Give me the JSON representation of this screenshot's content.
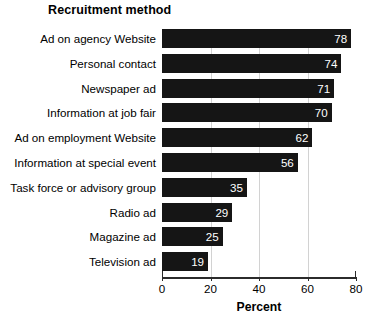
{
  "chart_data": {
    "type": "bar",
    "orientation": "horizontal",
    "title": "Recruitment method",
    "xlabel": "Percent",
    "ylabel": "",
    "xlim": [
      0,
      80
    ],
    "xticks": [
      0,
      20,
      40,
      60,
      80
    ],
    "xtick_labels": [
      "0",
      "20",
      "40",
      "60",
      "80"
    ],
    "grid": "vertical",
    "legend": "none",
    "bar_color": "#151515",
    "value_label_color": "#ffffff",
    "categories": [
      "Ad on agency Website",
      "Personal contact",
      "Newspaper ad",
      "Information at job fair",
      "Ad on employment Website",
      "Information at special event",
      "Task force or advisory group",
      "Radio ad",
      "Magazine ad",
      "Television ad"
    ],
    "values": [
      78,
      74,
      71,
      70,
      62,
      56,
      35,
      29,
      25,
      19
    ],
    "value_labels": [
      "78",
      "74",
      "71",
      "70",
      "62",
      "56",
      "35",
      "29",
      "25",
      "19"
    ]
  }
}
